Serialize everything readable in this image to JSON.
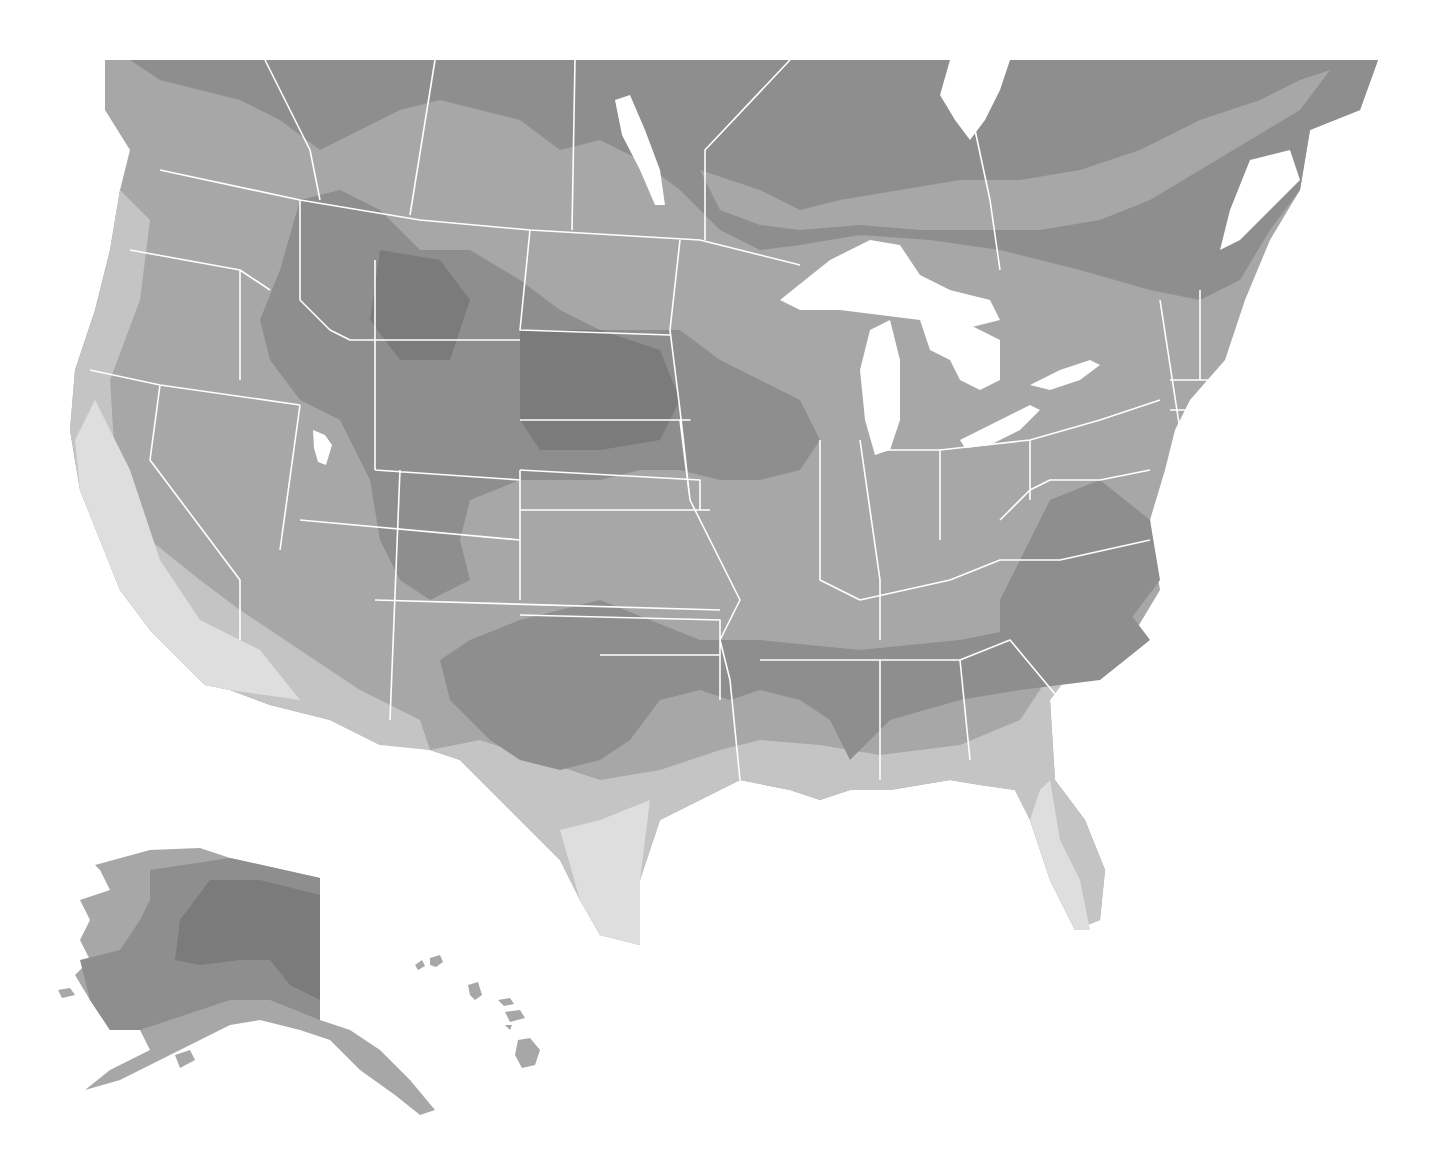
{
  "map": {
    "title": "",
    "type": "zone map (grayscale)",
    "region": "North America — contiguous United States and southern Canada with Alaska and Hawaii insets",
    "zones": [
      {
        "id": "zone-1",
        "shade": "#7b7b7b",
        "label": ""
      },
      {
        "id": "zone-2",
        "shade": "#8e8e8e",
        "label": ""
      },
      {
        "id": "zone-3",
        "shade": "#a7a7a7",
        "label": ""
      },
      {
        "id": "zone-4",
        "shade": "#c4c4c4",
        "label": ""
      },
      {
        "id": "zone-5",
        "shade": "#dedede",
        "label": ""
      }
    ],
    "water_color": "#ffffff",
    "border_color": "#ffffff",
    "insets": [
      "Alaska",
      "Hawaii"
    ],
    "corner_mark": ""
  }
}
